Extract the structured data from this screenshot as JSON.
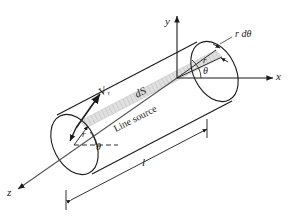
{
  "figure": {
    "background_color": "#ffffff",
    "line_color": "#1a1a1a",
    "strip_fill": "#d9d9d9"
  },
  "axes": [
    {
      "name": "y-axis",
      "label": "y",
      "direction": "up"
    },
    {
      "name": "x-axis",
      "label": "x",
      "direction": "right"
    },
    {
      "name": "z-axis",
      "label": "z",
      "direction": "down-left"
    }
  ],
  "labels": {
    "axis_y": "y",
    "axis_x": "x",
    "axis_z": "z",
    "arc_element": "r dθ",
    "radius_right": "r",
    "theta_right": "θ",
    "radius_left": "r",
    "theta_left": "θ",
    "velocity_symbol": "V",
    "velocity_subscript": "r",
    "surface_element": "dS",
    "line_source": "Line source",
    "length": "l"
  },
  "annotations": {
    "strip": "shaded differential surface strip dS running along cylinder length",
    "dimension": "double-headed dimension line marking cylinder length l",
    "dashed_reference": "dashed horizontal reference line through left circle centre"
  }
}
